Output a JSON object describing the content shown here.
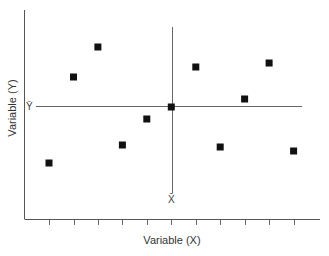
{
  "chart_data": {
    "type": "scatter",
    "title": "",
    "xlabel": "Variable (X)",
    "ylabel": "Variable (Y)",
    "grid": false,
    "legend": null,
    "x_ticks_count": 11,
    "x_tick_labels": [],
    "y_tick_labels": [],
    "xlim": [
      0,
      12
    ],
    "ylim": [
      0,
      10
    ],
    "points": [
      {
        "x": 1,
        "y": 2.8
      },
      {
        "x": 2,
        "y": 7.1
      },
      {
        "x": 3,
        "y": 8.6
      },
      {
        "x": 4,
        "y": 3.7
      },
      {
        "x": 5,
        "y": 5.0
      },
      {
        "x": 6,
        "y": 5.6
      },
      {
        "x": 7,
        "y": 7.6
      },
      {
        "x": 8,
        "y": 3.6
      },
      {
        "x": 9,
        "y": 6.0
      },
      {
        "x": 10,
        "y": 7.8
      },
      {
        "x": 11,
        "y": 3.4
      }
    ],
    "annotations": [
      {
        "type": "hline",
        "label": "Ȳ",
        "value": 5.6,
        "description": "mean of Y"
      },
      {
        "type": "vline",
        "label": "X̄",
        "value": 6,
        "description": "mean of X"
      }
    ],
    "marker": "square",
    "marker_color": "#111111"
  },
  "labels": {
    "x_axis": "Variable (X)",
    "y_axis": "Variable (Y)",
    "y_mean": "Ȳ",
    "x_mean": "X̄"
  }
}
